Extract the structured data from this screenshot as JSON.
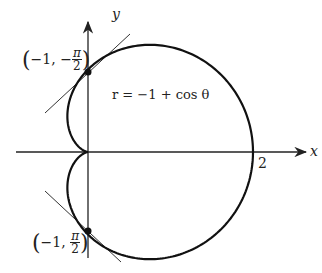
{
  "diagram": {
    "equation": "r = −1 + cos θ",
    "axes": {
      "x_label": "x",
      "y_label": "y",
      "x_tick": "2"
    },
    "points": [
      {
        "label_r": "−1,",
        "label_sign": "−",
        "label_num": "π",
        "label_den": "2",
        "x": 0,
        "y": 1
      },
      {
        "label_r": "−1,",
        "label_sign": "",
        "label_num": "π",
        "label_den": "2",
        "x": 0,
        "y": -1
      }
    ],
    "colors": {
      "curve": "#111111",
      "axis": "#222222",
      "tangent": "#333333"
    },
    "layout": {
      "origin_x": 88,
      "origin_y": 152,
      "scale": 82.5
    }
  }
}
